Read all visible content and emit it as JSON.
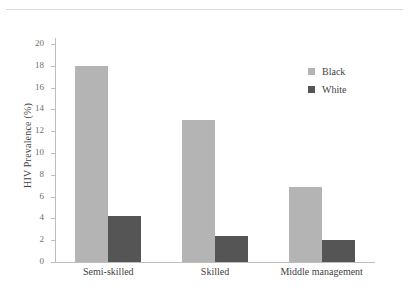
{
  "caption": {
    "text": "",
    "visible_rule": true
  },
  "legend": {
    "position": "top-right",
    "entries": [
      {
        "label": "Black",
        "color": "#b4b4b4"
      },
      {
        "label": "White",
        "color": "#555555"
      }
    ]
  },
  "axes": {
    "ylabel": "HIV Prevalence (%)",
    "xlabel": "",
    "yticks": [
      "0",
      "2",
      "4",
      "6",
      "8",
      "10",
      "12",
      "14",
      "16",
      "18",
      "20"
    ]
  },
  "chart_data": {
    "type": "bar",
    "title": "",
    "xlabel": "",
    "ylabel": "HIV Prevalence (%)",
    "ylim": [
      0,
      20
    ],
    "ytick_step": 2,
    "grid": false,
    "legend_position": "top-right",
    "categories": [
      "Semi-skilled",
      "Skilled",
      "Middle management"
    ],
    "series": [
      {
        "name": "Black",
        "color": "#b4b4b4",
        "values": [
          18.0,
          13.0,
          6.9
        ]
      },
      {
        "name": "White",
        "color": "#555555",
        "values": [
          4.2,
          2.4,
          2.0
        ]
      }
    ]
  }
}
